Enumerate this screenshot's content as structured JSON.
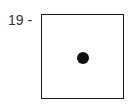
{
  "figure": {
    "label": "19 -",
    "box": {
      "shape": "square-outline",
      "stroke_color": "#1a1a1a"
    },
    "dot": {
      "shape": "filled-circle",
      "color": "#111111",
      "position": "center"
    }
  }
}
